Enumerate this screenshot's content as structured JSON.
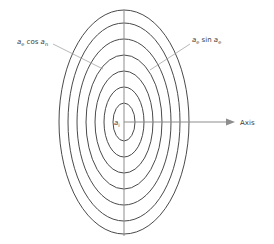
{
  "figure": {
    "title_visible": false,
    "background_color": "#ffffff",
    "curve_color": "#4a4a4a",
    "axis_color": "#8d8d8d",
    "leader_color": "#9a9a9a",
    "text_color": "#3a3a3a",
    "center": {
      "x": 124,
      "y": 122
    },
    "ellipses": [
      {
        "rx": 11,
        "ry": 19
      },
      {
        "rx": 20,
        "ry": 35
      },
      {
        "rx": 29,
        "ry": 51
      },
      {
        "rx": 38,
        "ry": 67
      },
      {
        "rx": 47,
        "ry": 83
      },
      {
        "rx": 56,
        "ry": 99
      },
      {
        "rx": 65,
        "ry": 112
      }
    ],
    "vertical_axis": {
      "x": 124,
      "y1": 10,
      "y2": 236
    },
    "horizontal_axis": {
      "y": 122,
      "x1": 124,
      "x2": 228
    }
  },
  "labels": {
    "left": {
      "base1": "a",
      "sub1": "e",
      "mid": " cos ",
      "base2": "a",
      "sub2": "n",
      "full_text": "a_e cos a_n"
    },
    "right": {
      "base1": "a",
      "sub1": "e",
      "mid": " sin ",
      "base2": "a",
      "sub2": "e",
      "full_text": "a_e sin a_e"
    },
    "center": {
      "base1": "a",
      "sub1": "i",
      "full_text": "a_i"
    },
    "axis": {
      "text": "Axis"
    }
  },
  "leaders": {
    "left": {
      "x1": 53,
      "y1": 44,
      "x2": 103,
      "y2": 69
    },
    "right": {
      "x1": 190,
      "y1": 44,
      "x2": 150,
      "y2": 70
    }
  },
  "icons": {
    "axis_arrow": "arrow-right-icon"
  }
}
